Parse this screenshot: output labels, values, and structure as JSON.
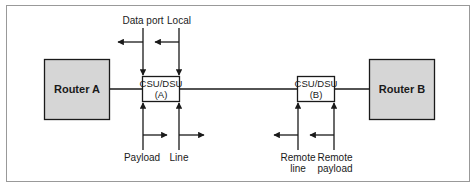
{
  "diagram": {
    "router_a": {
      "label": "Router A"
    },
    "router_b": {
      "label": "Router B"
    },
    "csu_a": {
      "line1": "CSU/DSU",
      "line2": "(A)"
    },
    "csu_b": {
      "line1": "CSU/DSU",
      "line2": "(B)"
    },
    "loopbacks": {
      "data_port": "Data port",
      "local": "Local",
      "payload": "Payload",
      "line": "Line",
      "remote_line": [
        "Remote",
        "line"
      ],
      "remote_payload": [
        "Remote",
        "payload"
      ]
    },
    "colors": {
      "router_fill": "#d6d6d6",
      "stroke": "#1a1a1a",
      "frame": "#999999"
    }
  }
}
